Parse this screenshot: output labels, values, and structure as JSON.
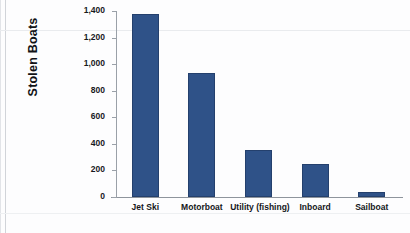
{
  "chart_data": {
    "type": "bar",
    "title": "",
    "xlabel": "",
    "ylabel": "Stolen Boats",
    "categories": [
      "Jet Ski",
      "Motorboat",
      "Utility (fishing)",
      "Inboard",
      "Sailboat"
    ],
    "values": [
      1375,
      935,
      355,
      245,
      40
    ],
    "ylim": [
      0,
      1400
    ],
    "yticks": [
      0,
      200,
      400,
      600,
      800,
      1000,
      1200,
      1400
    ],
    "ytick_labels": [
      "0",
      "200",
      "400",
      "600",
      "800",
      "1,000",
      "1,200",
      "1,400"
    ],
    "grid": false,
    "legend": null,
    "series": [
      {
        "name": "Stolen Boats",
        "color": "#2F5288",
        "values": [
          1375,
          935,
          355,
          245,
          40
        ]
      }
    ]
  },
  "colors": {
    "bar_fill": "#2F5288",
    "bar_edge": "#24406D",
    "axis": "#8E949C",
    "text": "#15171B",
    "background": "#FDFDFE"
  }
}
